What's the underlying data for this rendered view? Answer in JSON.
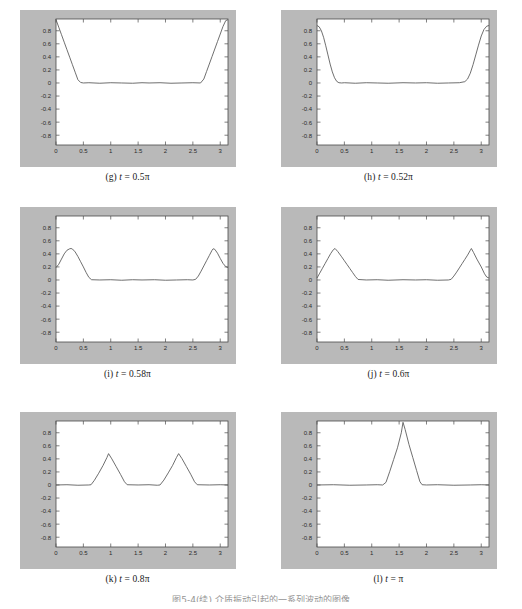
{
  "figure": {
    "caption": "图5-4(续)  介质振动引起的一系列波动的图像",
    "background_color": "#ffffff",
    "matte_color": "#b9b9b9",
    "axes_color": "#ffffff",
    "line_color": "#555555"
  },
  "axis": {
    "x_ticks": [
      "0",
      "0.5",
      "1",
      "1.5",
      "2",
      "2.5",
      "3"
    ],
    "x_tick_values": [
      0,
      0.5,
      1,
      1.5,
      2,
      2.5,
      3
    ],
    "y_ticks": [
      "0.8",
      "0.6",
      "0.4",
      "0.2",
      "0",
      "-0.2",
      "-0.4",
      "-0.6",
      "-0.8"
    ],
    "y_tick_values": [
      0.8,
      0.6,
      0.4,
      0.2,
      0,
      -0.2,
      -0.4,
      -0.6,
      -0.8
    ],
    "xlim": [
      0,
      3.1416
    ],
    "ylim": [
      -0.95,
      0.98
    ],
    "grid": false
  },
  "bleed_text": [
    {
      "text": "2",
      "x": 186,
      "y": 18,
      "size": 13
    },
    {
      "text": "π",
      "x": 180,
      "y": 34,
      "size": 12
    },
    {
      "text": "3π",
      "x": 172,
      "y": 56,
      "size": 13
    },
    {
      "text": "2",
      "x": 178,
      "y": 74,
      "size": 13
    },
    {
      "text": "3π",
      "x": 140,
      "y": 106,
      "size": 12
    },
    {
      "text": "2",
      "x": 146,
      "y": 124,
      "size": 12
    },
    {
      "text": "2π",
      "x": 196,
      "y": 106,
      "size": 12
    },
    {
      "text": "2",
      "x": 202,
      "y": 124,
      "size": 12
    },
    {
      "text": "≤ x ≤",
      "x": 168,
      "y": 114,
      "size": 10
    },
    {
      "text": "π",
      "x": 352,
      "y": 30,
      "size": 12
    },
    {
      "text": "π",
      "x": 334,
      "y": 58,
      "size": 12
    },
    {
      "text": "2",
      "x": 334,
      "y": 76,
      "size": 12
    },
    {
      "text": "≤ x ≤ π",
      "x": 352,
      "y": 70,
      "size": 10
    },
    {
      "text": "0 ≤ x ≤ π",
      "x": 340,
      "y": 134,
      "size": 10
    }
  ],
  "panels": [
    {
      "id": "g",
      "caption_label": "(g)",
      "caption_var": "t",
      "caption_eq": "= 0.5π",
      "t_label": "0.5π",
      "chart_data": {
        "type": "line",
        "title": "(g) t = 0.5π",
        "xlabel": "",
        "ylabel": "",
        "xlim": [
          0,
          3.1416
        ],
        "ylim": [
          -0.95,
          0.98
        ],
        "grid": false,
        "x": [
          0.0,
          0.05,
          0.1,
          0.15,
          0.2,
          0.25,
          0.3,
          0.35,
          0.4,
          0.45,
          0.5,
          0.6,
          0.8,
          1.0,
          1.2,
          1.4,
          1.571,
          1.7,
          1.9,
          2.1,
          2.3,
          2.5,
          2.64,
          2.7,
          2.75,
          2.8,
          2.85,
          2.9,
          2.95,
          3.0,
          3.05,
          3.1,
          3.1416
        ],
        "y": [
          0.97,
          0.855,
          0.74,
          0.625,
          0.51,
          0.395,
          0.28,
          0.165,
          0.05,
          0.008,
          0.0,
          0.004,
          -0.004,
          0.004,
          0.0,
          -0.004,
          0.004,
          0.0,
          0.004,
          -0.004,
          0.0,
          0.004,
          0.0,
          0.06,
          0.175,
          0.29,
          0.405,
          0.52,
          0.635,
          0.75,
          0.865,
          0.955,
          0.97
        ]
      }
    },
    {
      "id": "h",
      "caption_label": "(h)",
      "caption_var": "t",
      "caption_eq": "= 0.52π",
      "t_label": "0.52π",
      "chart_data": {
        "type": "line",
        "title": "(h) t = 0.52π",
        "xlabel": "",
        "ylabel": "",
        "xlim": [
          0,
          3.1416
        ],
        "ylim": [
          -0.95,
          0.98
        ],
        "grid": false,
        "x": [
          0.0,
          0.04,
          0.08,
          0.12,
          0.16,
          0.2,
          0.24,
          0.28,
          0.32,
          0.36,
          0.4,
          0.45,
          0.5,
          0.7,
          0.9,
          1.1,
          1.3,
          1.571,
          1.8,
          2.0,
          2.2,
          2.4,
          2.6,
          2.7,
          2.75,
          2.8,
          2.85,
          2.9,
          2.95,
          3.0,
          3.05,
          3.1,
          3.1416
        ],
        "y": [
          0.88,
          0.86,
          0.8,
          0.7,
          0.57,
          0.43,
          0.29,
          0.17,
          0.08,
          0.025,
          0.004,
          0.0,
          0.004,
          -0.004,
          0.004,
          0.0,
          -0.004,
          0.004,
          0.0,
          0.004,
          -0.004,
          0.0,
          0.004,
          0.02,
          0.06,
          0.15,
          0.28,
          0.43,
          0.58,
          0.72,
          0.82,
          0.87,
          0.88
        ]
      }
    },
    {
      "id": "i",
      "caption_label": "(i)",
      "caption_var": "t",
      "caption_eq": "= 0.58π",
      "t_label": "0.58π",
      "chart_data": {
        "type": "line",
        "title": "(i) t = 0.58π",
        "xlabel": "",
        "ylabel": "",
        "xlim": [
          0,
          3.1416
        ],
        "ylim": [
          -0.95,
          0.98
        ],
        "grid": false,
        "x": [
          0.0,
          0.05,
          0.1,
          0.15,
          0.2,
          0.25,
          0.275,
          0.3,
          0.35,
          0.4,
          0.45,
          0.5,
          0.55,
          0.6,
          0.65,
          0.8,
          1.0,
          1.2,
          1.4,
          1.571,
          1.8,
          2.0,
          2.2,
          2.4,
          2.5,
          2.55,
          2.6,
          2.65,
          2.7,
          2.75,
          2.8,
          2.85,
          2.87,
          2.9,
          2.95,
          3.0,
          3.05,
          3.1,
          3.1416
        ],
        "y": [
          0.19,
          0.24,
          0.32,
          0.4,
          0.455,
          0.478,
          0.482,
          0.475,
          0.43,
          0.36,
          0.28,
          0.2,
          0.115,
          0.04,
          0.004,
          0.0,
          0.004,
          -0.004,
          0.004,
          0.0,
          0.004,
          -0.004,
          0.0,
          0.004,
          0.0,
          0.01,
          0.06,
          0.135,
          0.215,
          0.295,
          0.375,
          0.455,
          0.478,
          0.47,
          0.41,
          0.33,
          0.255,
          0.205,
          0.19
        ]
      }
    },
    {
      "id": "j",
      "caption_label": "(j)",
      "caption_var": "t",
      "caption_eq": "= 0.6π",
      "t_label": "0.6π",
      "chart_data": {
        "type": "line",
        "title": "(j) t = 0.6π",
        "xlabel": "",
        "ylabel": "",
        "xlim": [
          0,
          3.1416
        ],
        "ylim": [
          -0.95,
          0.98
        ],
        "grid": false,
        "x": [
          0.0,
          0.05,
          0.1,
          0.15,
          0.2,
          0.25,
          0.3,
          0.33,
          0.38,
          0.45,
          0.5,
          0.55,
          0.6,
          0.65,
          0.7,
          0.75,
          0.9,
          1.1,
          1.3,
          1.571,
          1.8,
          2.0,
          2.2,
          2.4,
          2.45,
          2.5,
          2.55,
          2.6,
          2.65,
          2.7,
          2.75,
          2.8,
          2.82,
          2.86,
          2.92,
          3.0,
          3.06,
          3.1,
          3.1416
        ],
        "y": [
          0.03,
          0.105,
          0.18,
          0.255,
          0.33,
          0.405,
          0.465,
          0.482,
          0.435,
          0.355,
          0.295,
          0.235,
          0.175,
          0.115,
          0.055,
          0.008,
          0.0,
          0.004,
          -0.004,
          0.004,
          0.0,
          0.004,
          -0.004,
          0.0,
          0.01,
          0.06,
          0.12,
          0.185,
          0.25,
          0.315,
          0.38,
          0.455,
          0.482,
          0.42,
          0.32,
          0.2,
          0.095,
          0.045,
          0.03
        ]
      }
    },
    {
      "id": "k",
      "caption_label": "(k)",
      "caption_var": "t",
      "caption_eq": "= 0.8π",
      "t_label": "0.8π",
      "chart_data": {
        "type": "line",
        "title": "(k) t = 0.8π",
        "xlabel": "",
        "ylabel": "",
        "xlim": [
          0,
          3.1416
        ],
        "ylim": [
          -0.95,
          0.98
        ],
        "grid": false,
        "x": [
          0.0,
          0.2,
          0.4,
          0.6,
          0.64,
          0.7,
          0.78,
          0.86,
          0.93,
          0.96,
          1.02,
          1.1,
          1.18,
          1.25,
          1.3,
          1.5,
          1.7,
          1.85,
          1.9,
          1.97,
          2.05,
          2.13,
          2.2,
          2.24,
          2.3,
          2.38,
          2.46,
          2.53,
          2.58,
          2.8,
          3.0,
          3.1416
        ],
        "y": [
          0.0,
          0.004,
          -0.004,
          0.0,
          0.004,
          0.07,
          0.18,
          0.3,
          0.42,
          0.48,
          0.4,
          0.28,
          0.16,
          0.05,
          0.004,
          0.0,
          0.004,
          -0.004,
          0.0,
          0.075,
          0.185,
          0.3,
          0.42,
          0.48,
          0.405,
          0.285,
          0.165,
          0.05,
          0.004,
          0.0,
          0.004,
          0.0
        ]
      }
    },
    {
      "id": "l",
      "caption_label": "(l)",
      "caption_var": "t",
      "caption_eq": "= π",
      "t_label": "π",
      "chart_data": {
        "type": "line",
        "title": "(l) t = π",
        "xlabel": "",
        "ylabel": "",
        "xlim": [
          0,
          3.1416
        ],
        "ylim": [
          -0.95,
          0.98
        ],
        "grid": false,
        "x": [
          0.0,
          0.3,
          0.6,
          0.9,
          1.1,
          1.2,
          1.26,
          1.33,
          1.4,
          1.47,
          1.54,
          1.571,
          1.61,
          1.68,
          1.75,
          1.82,
          1.88,
          1.92,
          2.0,
          2.2,
          2.5,
          2.8,
          3.0,
          3.1416
        ],
        "y": [
          0.0,
          0.004,
          -0.004,
          0.0,
          0.004,
          0.0,
          0.04,
          0.21,
          0.39,
          0.57,
          0.8,
          0.96,
          0.85,
          0.62,
          0.42,
          0.22,
          0.05,
          0.004,
          0.0,
          0.004,
          -0.004,
          0.0,
          0.004,
          0.0
        ]
      }
    }
  ]
}
